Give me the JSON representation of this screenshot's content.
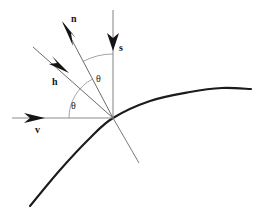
{
  "figure": {
    "kind": "vector-diagram",
    "title": "",
    "background_color": "#ffffff",
    "width": 264,
    "height": 216
  },
  "colors": {
    "axis_line": "#8c8c8c",
    "vector_line": "#6b6b6b",
    "arrow_fill": "#141414",
    "curve": "#1b1b1b",
    "arc": "#9a9a9a",
    "label_text": "#151515",
    "angle_text": "#202020"
  },
  "origin": {
    "x": 113,
    "y": 118
  },
  "labels": {
    "normal_vector": "n",
    "surface_vector": "s",
    "half_vector": "h",
    "view_vector": "v",
    "angle_upper": "θ",
    "angle_lower": "θ"
  },
  "label_positions": {
    "normal_vector": {
      "x": 71,
      "y": 22
    },
    "surface_vector": {
      "x": 119,
      "y": 51
    },
    "half_vector": {
      "x": 52,
      "y": 85
    },
    "view_vector": {
      "x": 35,
      "y": 133
    },
    "angle_upper": {
      "x": 96,
      "y": 82
    },
    "angle_lower": {
      "x": 71,
      "y": 109
    }
  },
  "vectors": [
    {
      "name": "n",
      "description": "normal vector pointing up-left from origin",
      "from": {
        "x": 113,
        "y": 118
      },
      "to": {
        "x": 63,
        "y": 23
      },
      "arrowhead": true
    },
    {
      "name": "s",
      "description": "surface/light vector pointing down along vertical axis",
      "from": {
        "x": 113,
        "y": 10
      },
      "to": {
        "x": 113,
        "y": 118
      },
      "arrowhead_at": {
        "x": 113,
        "y": 49
      },
      "arrowhead": true
    },
    {
      "name": "h",
      "description": "half vector pointing down-right toward origin",
      "from": {
        "x": 33,
        "y": 47
      },
      "to": {
        "x": 113,
        "y": 118
      },
      "arrowhead_at": {
        "x": 68,
        "y": 72
      },
      "arrowhead": true
    },
    {
      "name": "v",
      "description": "view vector along horizontal axis pointing right",
      "from": {
        "x": 12,
        "y": 118
      },
      "to": {
        "x": 113,
        "y": 118
      },
      "arrowhead_at": {
        "x": 43,
        "y": 118
      },
      "arrowhead": true
    }
  ],
  "normal_extension": {
    "description": "continuation of normal line below the surface",
    "from": {
      "x": 113,
      "y": 118
    },
    "to": {
      "x": 139,
      "y": 163
    }
  },
  "arcs": [
    {
      "name": "angle-lower-arc",
      "description": "angle between view vector and normal vector",
      "radius": 44,
      "start_angle_deg": 180,
      "end_angle_deg": 118
    },
    {
      "name": "angle-upper-arc",
      "description": "angle between normal vector and vertical surface axis",
      "radius": 64,
      "start_angle_deg": 118,
      "end_angle_deg": 90
    }
  ],
  "surface_curve": {
    "description": "curved surface passing through the origin",
    "points": [
      {
        "x": 30,
        "y": 206
      },
      {
        "x": 60,
        "y": 170
      },
      {
        "x": 90,
        "y": 138
      },
      {
        "x": 113,
        "y": 118
      },
      {
        "x": 150,
        "y": 101
      },
      {
        "x": 190,
        "y": 92
      },
      {
        "x": 222,
        "y": 88
      },
      {
        "x": 251,
        "y": 89
      }
    ]
  }
}
